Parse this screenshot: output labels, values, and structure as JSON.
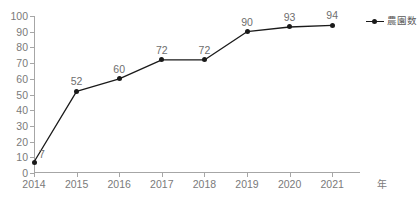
{
  "chart_data": {
    "type": "line",
    "title": "",
    "xlabel": "年",
    "ylabel": "",
    "categories": [
      "2014",
      "2015",
      "2016",
      "2017",
      "2018",
      "2019",
      "2020",
      "2021"
    ],
    "series": [
      {
        "name": "農園数",
        "values": [
          7,
          52,
          60,
          72,
          72,
          90,
          93,
          94
        ]
      }
    ],
    "point_labels": [
      "7",
      "52",
      "60",
      "72",
      "72",
      "90",
      "93",
      "94"
    ],
    "ylim": [
      0,
      100
    ],
    "ytick_step": 10,
    "yticks": [
      "0",
      "10",
      "20",
      "30",
      "40",
      "50",
      "60",
      "70",
      "80",
      "90",
      "100"
    ],
    "grid": false,
    "legend_position": "right",
    "marker": "circle",
    "colors": {
      "series_line": "#1a1a1a",
      "marker": "#1a1a1a",
      "axis": "#a6a6a6",
      "tick_label": "#7a7a7a",
      "data_label": "#6e6e6e",
      "background": "#ffffff"
    }
  },
  "legend": {
    "entries": [
      {
        "label": "農園数",
        "marker_icon": "line-dot-marker-icon"
      }
    ]
  },
  "axes": {
    "x_axis_title": "年",
    "x_tick_labels": [
      "2014",
      "2015",
      "2016",
      "2017",
      "2018",
      "2019",
      "2020",
      "2021"
    ],
    "y_tick_labels": [
      "100",
      "90",
      "80",
      "70",
      "60",
      "50",
      "40",
      "30",
      "20",
      "10",
      "0"
    ]
  }
}
